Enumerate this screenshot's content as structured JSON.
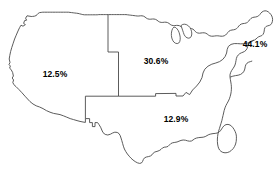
{
  "figure": {
    "type": "choropleth-label-map",
    "background_color": "#ffffff",
    "outline_color": "#4a4a4a",
    "label_color": "#000000"
  },
  "chart_data": {
    "type": "map",
    "title": "",
    "subtitle": "",
    "xlabel": "",
    "ylabel": "",
    "categories": [
      "West",
      "Midwest",
      "South",
      "Northeast"
    ],
    "values": [
      12.5,
      30.6,
      12.9,
      44.1
    ],
    "value_unit": "%",
    "labels": [
      "12.5%",
      "30.6%",
      "12.9%",
      "44.1%"
    ],
    "regions": [
      {
        "name": "West",
        "value": 12.5,
        "label": "12.5%",
        "label_x": 55,
        "label_y": 74
      },
      {
        "name": "Midwest",
        "value": 30.6,
        "label": "30.6%",
        "label_x": 156,
        "label_y": 61
      },
      {
        "name": "South",
        "value": 12.9,
        "label": "12.9%",
        "label_x": 176,
        "label_y": 119
      },
      {
        "name": "Northeast",
        "value": 44.1,
        "label": "44.1%",
        "label_x": 255,
        "label_y": 44
      }
    ],
    "legend": [],
    "grid": false
  }
}
